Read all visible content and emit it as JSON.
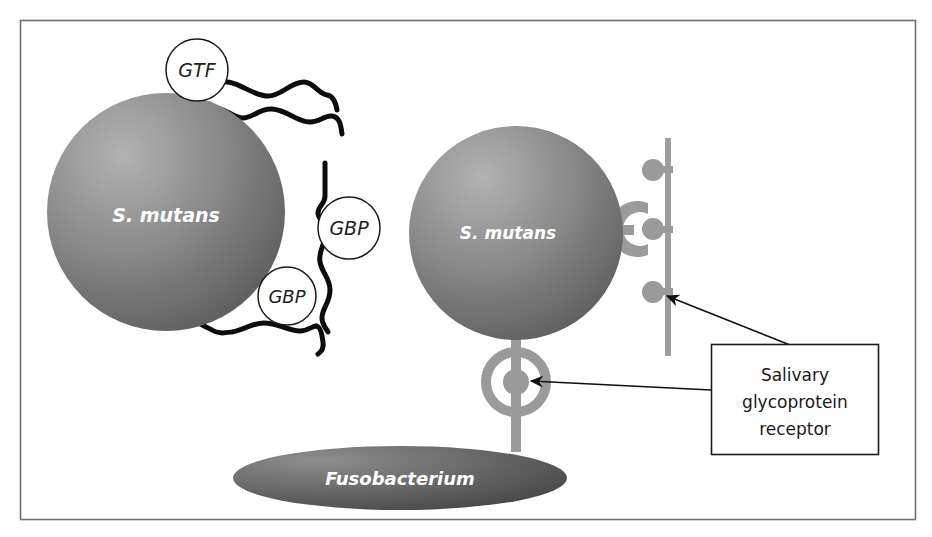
{
  "figure": {
    "background_color": "#ffffff",
    "frame_color": "#6b6b6b"
  },
  "cells": [
    {
      "id": "s-mutans-left",
      "label": "S. mutans",
      "shape": "circle",
      "cx": 166,
      "cy": 212,
      "r": 119,
      "fill_light": "#a8a8a8",
      "fill_dark": "#5e5e5e",
      "label_x": 166,
      "label_y": 222
    },
    {
      "id": "s-mutans-right",
      "label": "S. mutans",
      "shape": "circle",
      "cx": 516,
      "cy": 233,
      "r": 107,
      "fill_light": "#a8a8a8",
      "fill_dark": "#5e5e5e",
      "label_x": 508,
      "label_y": 239
    },
    {
      "id": "fusobacterium",
      "label": "Fusobacterium",
      "shape": "ellipse",
      "cx": 400,
      "cy": 478,
      "rx": 167,
      "ry": 32,
      "fill_light": "#8f8f8f",
      "fill_dark": "#4a4a4a",
      "label_x": 400,
      "label_y": 485
    }
  ],
  "proteins": [
    {
      "id": "gtf-top",
      "label": "GTF",
      "cx": 197,
      "cy": 70,
      "r": 31
    },
    {
      "id": "gbp-middle",
      "label": "GBP",
      "cx": 349,
      "cy": 228,
      "r": 31
    },
    {
      "id": "gbp-lower",
      "label": "GBP",
      "cx": 287,
      "cy": 296,
      "r": 29
    }
  ],
  "receptors": {
    "color": "#9a9a9a",
    "surface_line": {
      "id": "salivary-surface",
      "x": 668,
      "y_top": 138,
      "y_bottom": 356,
      "width": 6
    },
    "items": [
      {
        "id": "receptor-ball-top",
        "type": "ball-stub",
        "cx": 655,
        "cy": 170
      },
      {
        "id": "receptor-clamp-mid",
        "type": "clamp",
        "cx": 655,
        "cy": 229
      },
      {
        "id": "receptor-ball-bottom",
        "type": "ball-stub",
        "cx": 655,
        "cy": 292
      },
      {
        "id": "receptor-ring-fuso",
        "type": "ring",
        "cx": 516,
        "cy": 382
      }
    ]
  },
  "callout": {
    "id": "salivary-receptor-callout",
    "lines": [
      "Salivary",
      "glycoprotein",
      "receptor"
    ],
    "box": {
      "x": 711,
      "y": 344,
      "width": 167,
      "height": 110
    },
    "border_color": "#1a1a1a",
    "arrows": [
      {
        "id": "arrow-to-surface-receptor",
        "from_x": 790,
        "from_y": 345,
        "to_x": 665,
        "to_y": 295
      },
      {
        "id": "arrow-to-fuso-receptor",
        "from_x": 711,
        "from_y": 390,
        "to_x": 529,
        "to_y": 381
      }
    ]
  },
  "glucans": {
    "color": "#0d0d0d",
    "stroke_width": 5,
    "chains": [
      {
        "id": "glucan-upper-strand",
        "d": "M 222 82 C 238 80 252 96 268 96 C 282 96 290 82 304 82 C 314 82 318 94 327 95 C 334 96 336 104 337 110"
      },
      {
        "id": "glucan-lower-strand",
        "d": "M 212 107 C 226 108 233 118 243 118 C 253 118 260 108 272 109 C 288 110 296 122 310 122 C 320 122 325 115 332 116 C 340 117 341 126 342 134"
      },
      {
        "id": "glucan-vertical-strand",
        "d": "M 325 163 L 325 196 C 325 204 318 206 318 213 C 318 220 326 222 326 231 C 326 244 318 250 320 262 C 322 273 330 278 330 290 C 330 303 322 308 322 318 C 322 325 326 328 328 332"
      },
      {
        "id": "glucan-lower-left-strand",
        "d": "M 166 293 C 178 293 184 301 190 303 C 196 305 194 313 196 319 C 198 325 206 326 212 330 C 218 334 224 333 232 332 C 244 330 252 323 264 323 C 278 323 288 331 300 331 C 308 331 312 326 316 326"
      },
      {
        "id": "glucan-lower-tail",
        "d": "M 316 326 C 320 326 322 334 323 342 C 324 348 321 352 318 354"
      }
    ]
  }
}
